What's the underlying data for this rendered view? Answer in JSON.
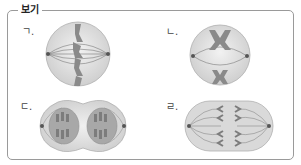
{
  "box": {
    "title": "보기"
  },
  "panels": [
    {
      "label": "ㄱ.",
      "stage": "metaphase-like (chromosomes along equator, spindle poles left/right)"
    },
    {
      "label": "ㄴ.",
      "stage": "chromosome pairs separating toward top and bottom"
    },
    {
      "label": "ㄷ.",
      "stage": "two nuclei forming, cell pinching (telophase)"
    },
    {
      "label": "ㄹ.",
      "stage": "chromatids moving to opposite poles (anaphase)"
    }
  ],
  "colors": {
    "border": "#9a9a9a",
    "cell_fill": "#e6e6e6",
    "chromosome": "#8a8a8a",
    "spindle": "#7a7a7a"
  }
}
